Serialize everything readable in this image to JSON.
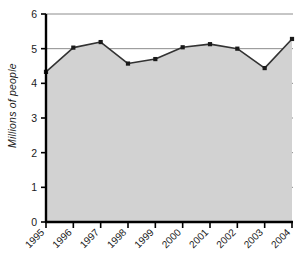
{
  "chart_data": {
    "type": "area",
    "title": "",
    "subtitle": "",
    "xlabel": "",
    "ylabel": "Millions of people",
    "categories": [
      "1995",
      "1996",
      "1997",
      "1998",
      "1999",
      "2000",
      "2001",
      "2002",
      "2003",
      "2004"
    ],
    "values": [
      4.33,
      5.03,
      5.19,
      4.57,
      4.7,
      5.04,
      5.13,
      5.0,
      4.44,
      5.28
    ],
    "series": [
      {
        "name": "Millions of people",
        "values": [
          4.33,
          5.03,
          5.19,
          4.57,
          4.7,
          5.04,
          5.13,
          5.0,
          4.44,
          5.28
        ]
      }
    ],
    "ylim": [
      0,
      6
    ],
    "yticks": [
      0,
      1,
      2,
      3,
      4,
      5,
      6
    ],
    "ytick_labels": [
      "0",
      "1",
      "2",
      "3",
      "4",
      "5",
      "6"
    ],
    "xtick_labels": [
      "1995",
      "1996",
      "1997",
      "1998",
      "1999",
      "2000",
      "2001",
      "2002",
      "2003",
      "2004"
    ],
    "grid": true,
    "grid_axis": "y",
    "legend": false,
    "legend_position": "none",
    "marker": "square",
    "colors": {
      "area_fill": "#d2d2d2",
      "line": "#333333",
      "marker": "#1a1a1a",
      "gridline": "#8c8c8c",
      "axis": "#000000",
      "text": "#1a1a1a",
      "background": "#ffffff"
    }
  }
}
